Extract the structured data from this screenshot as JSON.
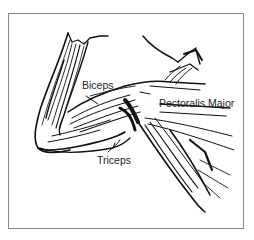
{
  "figure": {
    "labels": {
      "biceps": "Biceps",
      "pectoralis_major": "Pectoralis Major",
      "triceps": "Triceps"
    },
    "colors": {
      "ink": "#111111",
      "border": "#8a8a8a",
      "background": "#ffffff"
    }
  }
}
